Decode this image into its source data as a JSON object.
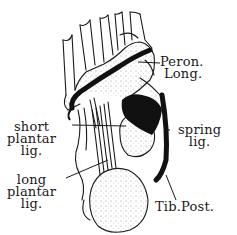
{
  "figure": {
    "ink_color": "#1a1a1a",
    "paper_color": "#ffffff",
    "labels": {
      "peron_long": {
        "line1": "Peron.",
        "line2": "Long."
      },
      "short_plantar": {
        "line1": "short",
        "line2": "plantar",
        "line3": "lig."
      },
      "spring": {
        "line1": "spring",
        "line2": "lig."
      },
      "long_plantar": {
        "line1": "long",
        "line2": "plantar",
        "line3": "lig."
      },
      "tib_post": {
        "line1": "Tib.Post."
      }
    }
  }
}
